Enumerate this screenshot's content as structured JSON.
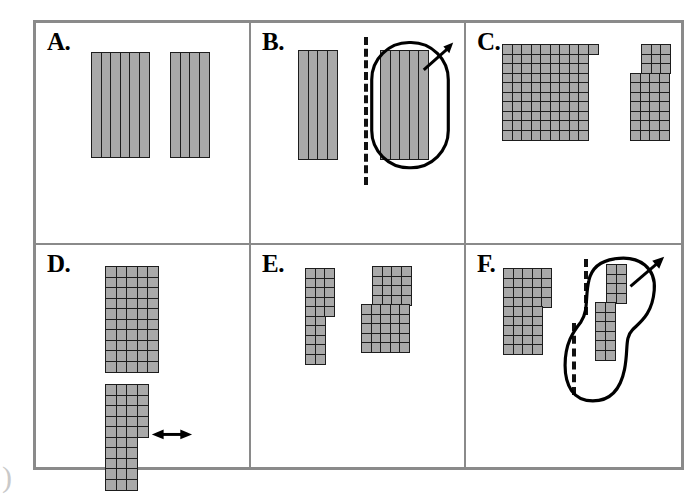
{
  "document": {
    "title": "Block Comparison Worksheet",
    "border_color": "#8a8a8a",
    "fill_color": "#a9a9a9",
    "outline_color": "#1d1d1d",
    "background": "#ffffff",
    "stray_mark": ")"
  },
  "panels": [
    {
      "id": "A",
      "label": "A.",
      "has_dashed_divider": false,
      "has_loop": false,
      "has_arrow": false,
      "has_double_arrow": false,
      "shape_style": "strips",
      "shapes": [
        {
          "name": "left-strip-block",
          "strips": 6,
          "strip_width": 11,
          "height": 106,
          "x": 56,
          "y": 30
        },
        {
          "name": "right-strip-block",
          "strips": 4,
          "strip_width": 11,
          "height": 106,
          "x": 135,
          "y": 30
        }
      ]
    },
    {
      "id": "B",
      "label": "B.",
      "has_dashed_divider": true,
      "has_loop": true,
      "has_arrow": true,
      "has_double_arrow": false,
      "shape_style": "strips",
      "shapes": [
        {
          "name": "left-strip-block",
          "strips": 4,
          "strip_width": 11,
          "height": 110,
          "x": 48,
          "y": 28
        },
        {
          "name": "right-strip-block-circled",
          "strips": 5,
          "strip_width": 11,
          "height": 110,
          "x": 130,
          "y": 28
        }
      ]
    },
    {
      "id": "C",
      "label": "C.",
      "has_dashed_divider": false,
      "has_loop": false,
      "has_arrow": false,
      "has_double_arrow": false,
      "shape_style": "grid",
      "shapes": [
        {
          "name": "left-grid-block",
          "x": 37,
          "y": 22,
          "cell": 11,
          "rows": [
            10,
            9,
            9,
            9,
            9,
            9,
            9,
            9,
            9,
            9
          ],
          "align": "left"
        },
        {
          "name": "right-step-block",
          "x": 165,
          "y": 22,
          "cell": 11,
          "rows": [
            3,
            3,
            3,
            4,
            4,
            4,
            4,
            4,
            4,
            4
          ],
          "align": "right"
        }
      ]
    },
    {
      "id": "D",
      "label": "D.",
      "has_dashed_divider": false,
      "has_loop": false,
      "has_arrow": false,
      "has_double_arrow": true,
      "shape_style": "grid",
      "shapes": [
        {
          "name": "upper-grid-block",
          "x": 70,
          "y": 22,
          "cell": 12,
          "rows": [
            5,
            5,
            5,
            5,
            5,
            5,
            5,
            5,
            5,
            5
          ],
          "align": "left"
        },
        {
          "name": "lower-step-block",
          "x": 70,
          "y": 140,
          "cell": 12,
          "rows": [
            4,
            4,
            4,
            4,
            4,
            3,
            3,
            3,
            3,
            3
          ],
          "align": "left"
        }
      ]
    },
    {
      "id": "E",
      "label": "E.",
      "has_dashed_divider": false,
      "has_loop": false,
      "has_arrow": false,
      "has_double_arrow": false,
      "shape_style": "grid",
      "shapes": [
        {
          "name": "left-step-block",
          "x": 55,
          "y": 24,
          "cell": 11,
          "rows": [
            3,
            3,
            3,
            3,
            3,
            2,
            2,
            2,
            2,
            2
          ],
          "align": "left"
        },
        {
          "name": "right-step-block",
          "x": 111,
          "y": 22,
          "cell": 11,
          "rows": [
            4,
            4,
            4,
            4,
            5,
            5,
            5,
            5,
            5
          ],
          "align": "right"
        }
      ]
    },
    {
      "id": "F",
      "label": "F.",
      "has_dashed_divider": true,
      "has_loop": true,
      "has_arrow": true,
      "has_double_arrow": false,
      "shape_style": "grid",
      "shapes": [
        {
          "name": "left-step-block",
          "x": 38,
          "y": 24,
          "cell": 11,
          "rows": [
            5,
            5,
            5,
            5,
            4,
            4,
            4,
            4,
            4
          ],
          "align": "left"
        },
        {
          "name": "right-step-block-circled",
          "x": 130,
          "y": 20,
          "cell": 11,
          "rows": [
            2,
            2,
            2,
            2,
            2,
            2,
            2,
            2,
            2,
            2
          ],
          "align": "right",
          "offsets": [
            1,
            1,
            1,
            1,
            0,
            0,
            0,
            0,
            0,
            0
          ]
        }
      ]
    }
  ]
}
